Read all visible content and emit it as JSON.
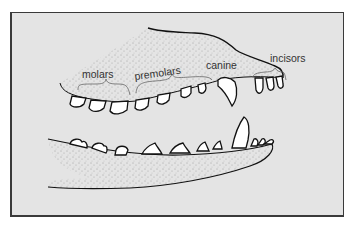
{
  "figure": {
    "labels": {
      "molars": "molars",
      "premolars": "premolars",
      "canine": "canine",
      "incisors": "incisors"
    },
    "colors": {
      "background": "#e4e4e4",
      "frame_border": "#3a3a3a",
      "tooth_fill": "#ffffff",
      "outline": "#111111"
    }
  }
}
